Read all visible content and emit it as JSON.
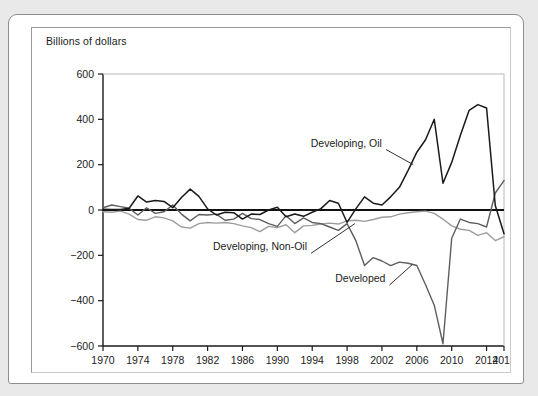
{
  "figure": {
    "axis_title": "Billions of dollars"
  },
  "chart_data": {
    "type": "line",
    "title": "",
    "subtitle": "",
    "xlabel": "",
    "ylabel": "Billions of dollars",
    "xlim": [
      1970,
      2016
    ],
    "ylim": [
      -600,
      600
    ],
    "xticks": [
      1970,
      1974,
      1978,
      1982,
      1986,
      1990,
      1994,
      1998,
      2002,
      2006,
      2010,
      2014,
      2016
    ],
    "xtick_labels": [
      "1970",
      "1974",
      "1978",
      "1982",
      "1986",
      "1990",
      "1994",
      "1998",
      "2002",
      "2006",
      "2010",
      "2014",
      "2016"
    ],
    "yticks": [
      -600,
      -400,
      -200,
      0,
      200,
      400,
      600
    ],
    "ytick_labels": [
      "−600",
      "−400",
      "−200",
      "0",
      "200",
      "400",
      "600"
    ],
    "grid": false,
    "legend": "inline-annotations",
    "zero_line": 0,
    "x": [
      1970,
      1971,
      1972,
      1973,
      1974,
      1975,
      1976,
      1977,
      1978,
      1979,
      1980,
      1981,
      1982,
      1983,
      1984,
      1985,
      1986,
      1987,
      1988,
      1989,
      1990,
      1991,
      1992,
      1993,
      1994,
      1995,
      1996,
      1997,
      1998,
      1999,
      2000,
      2001,
      2002,
      2003,
      2004,
      2005,
      2006,
      2007,
      2008,
      2009,
      2010,
      2011,
      2012,
      2013,
      2014,
      2015,
      2016
    ],
    "series": [
      {
        "name": "Developing, Oil",
        "color": "#1a1a1a",
        "width": 1.5,
        "values": [
          3,
          2,
          2,
          8,
          62,
          35,
          42,
          38,
          10,
          55,
          92,
          60,
          5,
          -22,
          -10,
          -12,
          -40,
          -18,
          -20,
          0,
          12,
          -30,
          -18,
          -28,
          -10,
          6,
          42,
          30,
          -55,
          5,
          58,
          30,
          22,
          58,
          100,
          175,
          255,
          310,
          400,
          118,
          210,
          330,
          440,
          465,
          450,
          20,
          -105
        ]
      },
      {
        "name": "Developed",
        "color": "#5e5e5e",
        "width": 1.4,
        "values": [
          10,
          22,
          15,
          8,
          -22,
          10,
          -15,
          -8,
          22,
          -18,
          -48,
          -20,
          -22,
          -18,
          -45,
          -40,
          -15,
          -38,
          -42,
          -60,
          -72,
          -25,
          -60,
          -35,
          -55,
          -60,
          -75,
          -90,
          -60,
          -135,
          -245,
          -210,
          -225,
          -245,
          -230,
          -235,
          -245,
          -330,
          -420,
          -590,
          -125,
          -40,
          -55,
          -60,
          -75,
          75,
          130
        ]
      },
      {
        "name": "Developing, Non-Oil",
        "color": "#9d9d9d",
        "width": 1.4,
        "values": [
          -8,
          -10,
          -5,
          -18,
          -42,
          -45,
          -30,
          -35,
          -48,
          -75,
          -80,
          -60,
          -55,
          -58,
          -55,
          -60,
          -70,
          -78,
          -95,
          -72,
          -78,
          -65,
          -100,
          -70,
          -68,
          -62,
          -58,
          -62,
          -48,
          -45,
          -50,
          -42,
          -32,
          -30,
          -18,
          -12,
          -8,
          -5,
          -15,
          -40,
          -70,
          -85,
          -90,
          -112,
          -100,
          -135,
          -118
        ]
      }
    ],
    "annotations": [
      {
        "text": "Developing, Oil",
        "x": 2002.0,
        "y": 280,
        "leader_to_x": 2005.6,
        "leader_to_y": 200
      },
      {
        "text": "Developing, Non-Oil",
        "x": 1993.4,
        "y": -178,
        "leader_to_x": 1998.9,
        "leader_to_y": -60
      },
      {
        "text": "Developed",
        "x": 2002.4,
        "y": -318,
        "leader_to_x": 2005.5,
        "leader_to_y": -240
      }
    ]
  }
}
